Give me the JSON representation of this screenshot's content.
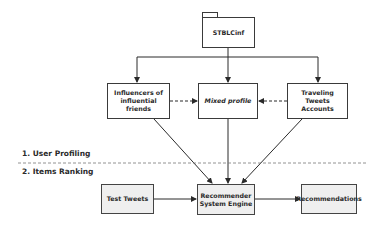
{
  "diagram": {
    "source": {
      "label": "STBLCinf",
      "shape": "folder"
    },
    "profiles": [
      {
        "label": "Influencers of\ninfluential\nfriends"
      },
      {
        "label": "Mixed profile",
        "italic": true
      },
      {
        "label": "Traveling\nTweets\nAccounts"
      }
    ],
    "phases": [
      {
        "label": "1. User Profiling"
      },
      {
        "label": "2. Items Ranking"
      }
    ],
    "ranking": [
      {
        "label": "Test Tweets"
      },
      {
        "label": "Recommender\nSystem Engine"
      },
      {
        "label": "Recommendations"
      }
    ],
    "edges": [
      {
        "from": "STBLCinf",
        "to": "Influencers of influential friends",
        "style": "solid"
      },
      {
        "from": "STBLCinf",
        "to": "Mixed profile",
        "style": "solid"
      },
      {
        "from": "STBLCinf",
        "to": "Traveling Tweets Accounts",
        "style": "solid"
      },
      {
        "from": "Influencers of influential friends",
        "to": "Mixed profile",
        "style": "dashed"
      },
      {
        "from": "Traveling Tweets Accounts",
        "to": "Mixed profile",
        "style": "dashed"
      },
      {
        "from": "Influencers of influential friends",
        "to": "Recommender System Engine",
        "style": "solid"
      },
      {
        "from": "Mixed profile",
        "to": "Recommender System Engine",
        "style": "solid"
      },
      {
        "from": "Traveling Tweets Accounts",
        "to": "Recommender System Engine",
        "style": "solid"
      },
      {
        "from": "Test Tweets",
        "to": "Recommender System Engine",
        "style": "solid"
      },
      {
        "from": "Recommender System Engine",
        "to": "Recommendations",
        "style": "solid"
      }
    ],
    "colors": {
      "stroke": "#3a3a3a",
      "gray_fill": "#efefef",
      "separator": "#777777"
    }
  }
}
